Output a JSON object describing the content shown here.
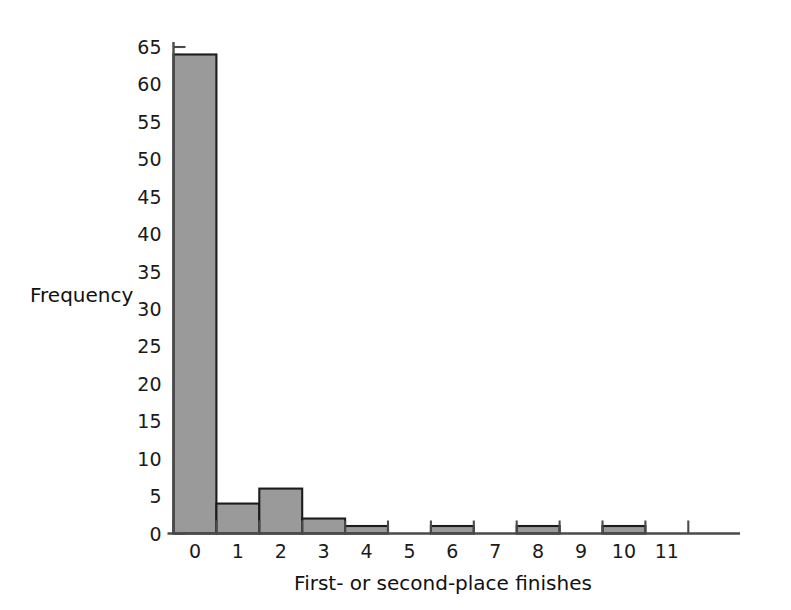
{
  "chart_data": {
    "type": "bar",
    "title": "",
    "subtitle": "",
    "xlabel": "First- or second-place finishes",
    "ylabel": "Frequency",
    "categories": [
      "0",
      "1",
      "2",
      "3",
      "4",
      "5",
      "6",
      "7",
      "8",
      "9",
      "10",
      "11"
    ],
    "values": [
      64,
      4,
      6,
      2,
      1,
      0,
      1,
      0,
      1,
      0,
      1,
      0
    ],
    "xlim": [
      -0.5,
      11.5
    ],
    "ylim": [
      0,
      65
    ],
    "y_ticks_major": [
      0,
      5,
      10,
      15,
      20,
      25,
      30,
      35,
      40,
      45,
      50,
      55,
      60,
      65
    ],
    "y_tick_minor_step": 1,
    "x_ticks": [
      "0",
      "1",
      "2",
      "3",
      "4",
      "5",
      "6",
      "7",
      "8",
      "9",
      "10",
      "11"
    ],
    "grid": "off",
    "legend": "none",
    "bar_fill_color": "#9a9a9a",
    "bar_edge_color": "#1c1c1c",
    "axis_color": "#4a4a4a",
    "background_color": "#ffffff",
    "bin_width": 1
  },
  "axis": {
    "y_title": "Frequency",
    "x_title": "First- or second-place finishes"
  }
}
